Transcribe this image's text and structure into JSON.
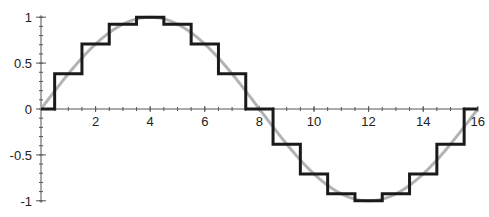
{
  "chart_data": {
    "type": "line",
    "title": "",
    "xlabel": "",
    "ylabel": "",
    "xlim": [
      0,
      16
    ],
    "ylim": [
      -1,
      1
    ],
    "grid": false,
    "legend": null,
    "x_ticks": [
      2,
      4,
      6,
      8,
      10,
      12,
      14,
      16
    ],
    "x_tick_labels": [
      "2",
      "4",
      "6",
      "8",
      "10",
      "12",
      "14",
      "16"
    ],
    "x_minor_step": 0.5,
    "y_ticks": [
      1,
      0.5,
      0,
      -0.5,
      -1
    ],
    "y_tick_labels": [
      "1",
      "0.5",
      "0",
      "-0.5",
      "-1"
    ],
    "y_minor_step": 0.1,
    "series": [
      {
        "name": "continuous sine",
        "style": "smooth",
        "color": "#b3b3b3",
        "function": "sin(2*pi*x/16)",
        "x_range": [
          0,
          16
        ]
      },
      {
        "name": "sampled (zero-order hold)",
        "style": "step",
        "color": "#1a1a1a",
        "sample_x": [
          0,
          1,
          2,
          3,
          4,
          5,
          6,
          7,
          8,
          9,
          10,
          11,
          12,
          13,
          14,
          15,
          16
        ],
        "values": [
          0,
          0.383,
          0.707,
          0.924,
          1,
          0.924,
          0.707,
          0.383,
          0,
          -0.383,
          -0.707,
          -0.924,
          -1,
          -0.924,
          -0.707,
          -0.383,
          0
        ]
      }
    ]
  },
  "plot": {
    "x0_px": 41,
    "x_unit_px": 27.3,
    "y0_px": 109,
    "y_unit_px": 91.8
  }
}
